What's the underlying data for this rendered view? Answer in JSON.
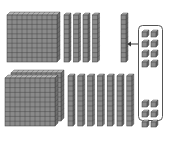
{
  "diagram": {
    "colors": {
      "block_face": "#8a8a8a",
      "block_side": "#6e6e6e",
      "block_top": "#b5b5b5",
      "grid_line": "#3a3a3a",
      "box_stroke": "#555555",
      "arrow": "#333333",
      "background": "#ffffff"
    },
    "top_row": {
      "hundreds_flats": 1,
      "ten_rods": 4,
      "regrouped_ten_rod": 1,
      "units_in_box": 8
    },
    "bottom_row": {
      "hundreds_flats": 2,
      "ten_rods": 7,
      "units_in_box": 2,
      "units_below_box": 4
    },
    "arrow": {
      "direction": "left",
      "from": "units-box",
      "to": "regrouped-ten-rod"
    }
  }
}
